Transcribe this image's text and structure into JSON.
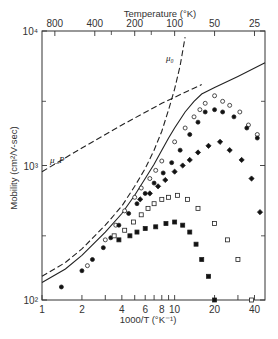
{
  "chart_data": {
    "type": "scatter",
    "title": "",
    "xlabel": "1000/T (°K⁻¹)",
    "ylabel": "Mobility (cm²/V-sec)",
    "top_axis_label": "Temperature (°K)",
    "xscale": "log",
    "yscale": "log",
    "xlim": [
      1,
      48
    ],
    "ylim": [
      100,
      10000
    ],
    "x_ticks": [
      1,
      2,
      3,
      4,
      5,
      6,
      7,
      8,
      9,
      10,
      20,
      30,
      40
    ],
    "x_tick_labels": [
      {
        "value": 1,
        "label": "1"
      },
      {
        "value": 2,
        "label": "2"
      },
      {
        "value": 4,
        "label": "4"
      },
      {
        "value": 6,
        "label": "6"
      },
      {
        "value": 8,
        "label": "8"
      },
      {
        "value": 10,
        "label": "10"
      },
      {
        "value": 20,
        "label": "20"
      },
      {
        "value": 40,
        "label": "40"
      }
    ],
    "y_tick_labels": [
      {
        "value": 100,
        "label": "10²"
      },
      {
        "value": 1000,
        "label": "10³"
      },
      {
        "value": 10000,
        "label": "10⁴"
      }
    ],
    "y_minor_ticks": [
      300,
      3000
    ],
    "top_tick_labels": [
      {
        "temperature": 800,
        "label": "800"
      },
      {
        "temperature": 400,
        "label": "400"
      },
      {
        "temperature": 200,
        "label": "200"
      },
      {
        "temperature": 100,
        "label": "100"
      },
      {
        "temperature": 50,
        "label": "50"
      },
      {
        "temperature": 25,
        "label": "25"
      }
    ],
    "top_minor_ticks": [
      300,
      150
    ],
    "annotations": [
      {
        "text": "μ₀",
        "x": 8.6,
        "y": 6000
      },
      {
        "text": "μ_P",
        "x": 1.15,
        "y": 1050
      }
    ],
    "series": [
      {
        "name": "mu_0 (theoretical)",
        "style": "dashed",
        "x": [
          1,
          1.5,
          2,
          3,
          4,
          5,
          6,
          7,
          8,
          9,
          10,
          11,
          12
        ],
        "y": [
          150,
          190,
          240,
          360,
          500,
          700,
          950,
          1300,
          1800,
          2600,
          3700,
          5500,
          9000
        ]
      },
      {
        "name": "mu_P (theoretical)",
        "style": "dashed",
        "x": [
          1,
          2,
          4,
          8,
          16
        ],
        "y": [
          900,
          1350,
          2000,
          2900,
          4000
        ]
      },
      {
        "name": "combined (theoretical)",
        "style": "solid",
        "x": [
          1,
          1.5,
          2,
          3,
          4,
          5,
          6,
          7,
          8,
          9,
          10,
          12,
          14,
          16,
          20,
          30,
          48
        ],
        "y": [
          135,
          170,
          215,
          320,
          440,
          600,
          800,
          1020,
          1300,
          1600,
          1900,
          2500,
          3000,
          3400,
          3800,
          4600,
          5800
        ]
      },
      {
        "name": "open circles",
        "marker": "circle-open",
        "x": [
          2.2,
          3.0,
          3.6,
          4.2,
          5.0,
          5.6,
          6.5,
          7.2,
          8.0,
          10.0,
          12.0,
          14.0,
          15.5,
          17.0,
          20.0,
          23.0,
          26.0,
          31.0,
          36.0,
          42.0
        ],
        "y": [
          180,
          280,
          360,
          460,
          580,
          680,
          800,
          920,
          1080,
          1500,
          1900,
          2300,
          2600,
          2900,
          3300,
          3000,
          2800,
          2500,
          2000,
          1700
        ]
      },
      {
        "name": "filled circles",
        "marker": "circle-filled",
        "x": [
          1.4,
          2.0,
          2.4,
          2.9,
          3.3,
          3.8,
          4.5,
          5.2,
          6.0,
          7.0,
          8.2,
          9.5,
          11.0,
          13.0,
          15.0,
          17.0,
          20.0,
          23.0,
          28.0,
          35.0,
          42.0
        ],
        "y": [
          125,
          165,
          200,
          245,
          290,
          360,
          440,
          520,
          620,
          740,
          880,
          1050,
          1300,
          1700,
          2100,
          2500,
          2600,
          2500,
          2300,
          1900,
          1600
        ]
      },
      {
        "name": "filled diamonds",
        "marker": "diamond-filled",
        "x": [
          5.5,
          6.5,
          7.5,
          8.5,
          10.0,
          11.5,
          13.0,
          15.0,
          18.0,
          22.0,
          26.0,
          32.0,
          38.0,
          44.0
        ],
        "y": [
          560,
          620,
          700,
          780,
          900,
          1000,
          1100,
          1250,
          1400,
          1500,
          1300,
          1100,
          800,
          450
        ]
      },
      {
        "name": "open squares",
        "marker": "square-open",
        "x": [
          3.5,
          4.2,
          4.9,
          5.6,
          6.3,
          7.0,
          8.0,
          9.0,
          10.5,
          12.5,
          15.0,
          20.0,
          25.0,
          30.0,
          38.0
        ],
        "y": [
          300,
          330,
          380,
          430,
          480,
          520,
          560,
          580,
          600,
          560,
          480,
          370,
          280,
          200,
          100
        ]
      },
      {
        "name": "filled squares",
        "marker": "square-filled",
        "x": [
          3.8,
          4.6,
          5.2,
          6.0,
          7.2,
          8.6,
          10.0,
          11.5,
          13.0,
          14.5,
          16.0,
          18.0,
          20.0
        ],
        "y": [
          280,
          300,
          320,
          340,
          350,
          370,
          380,
          360,
          320,
          260,
          200,
          150,
          100
        ]
      }
    ]
  }
}
